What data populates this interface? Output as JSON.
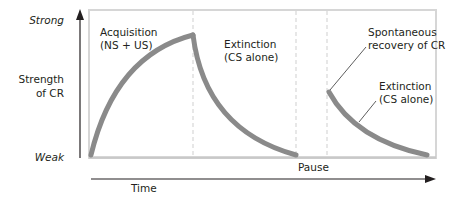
{
  "diagram": {
    "y_axis": {
      "top_label": "Strong",
      "bottom_label": "Weak",
      "title_line1": "Strength",
      "title_line2": "of CR"
    },
    "x_axis": {
      "label": "Time",
      "pause_label": "Pause"
    },
    "phases": [
      {
        "name": "acquisition",
        "line1": "Acquisition",
        "line2": "(NS + US)"
      },
      {
        "name": "extinction",
        "line1": "Extinction",
        "line2": "(CS alone)"
      },
      {
        "name": "spontaneous-recovery",
        "line1": "Spontaneous",
        "line2": "recovery of CR"
      },
      {
        "name": "extinction-2",
        "line1": "Extinction",
        "line2": "(CS alone)"
      }
    ],
    "colors": {
      "curve": "#8a8a8a",
      "frame": "#cfcfcf",
      "dashed": "#d0d0d0",
      "axis": "#231f20"
    }
  }
}
